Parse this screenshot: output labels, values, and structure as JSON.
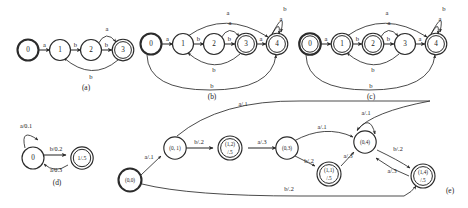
{
  "figure": {
    "background_color": "#ffffff",
    "stroke_color": "#2b2b2b",
    "text_color": "#1a1a1a"
  },
  "panels": [
    {
      "id": "a",
      "caption": "(a)",
      "nodes": [
        {
          "id": "a0",
          "label": "0",
          "shape": "start-circle"
        },
        {
          "id": "a1",
          "label": "1",
          "shape": "circle"
        },
        {
          "id": "a2",
          "label": "2",
          "shape": "circle"
        },
        {
          "id": "a3",
          "label": "3",
          "shape": "double-circle"
        }
      ],
      "edges": [
        {
          "from": "0",
          "to": "1",
          "label": "a"
        },
        {
          "from": "1",
          "to": "2",
          "label": "b"
        },
        {
          "from": "2",
          "to": "3",
          "label": "b"
        },
        {
          "from": "2",
          "to": "3",
          "label": "a",
          "style": "arc-top"
        },
        {
          "from": "3",
          "to": "1",
          "label": "b",
          "style": "arc-bottom"
        }
      ]
    },
    {
      "id": "b",
      "caption": "(b)",
      "nodes": [
        {
          "id": "b0",
          "label": "0",
          "shape": "start-circle"
        },
        {
          "id": "b1",
          "label": "1",
          "shape": "circle"
        },
        {
          "id": "b2",
          "label": "2",
          "shape": "circle"
        },
        {
          "id": "b3",
          "label": "3",
          "shape": "double-circle"
        },
        {
          "id": "b4",
          "label": "4",
          "shape": "double-circle"
        }
      ],
      "edges": [
        {
          "from": "0",
          "to": "1",
          "label": "a"
        },
        {
          "from": "1",
          "to": "2",
          "label": "b"
        },
        {
          "from": "2",
          "to": "3",
          "label": "b"
        },
        {
          "from": "3",
          "to": "4",
          "label": "a"
        },
        {
          "from": "2",
          "to": "3",
          "label": "a",
          "style": "arc-top-small"
        },
        {
          "from": "1",
          "to": "4",
          "label": "a",
          "style": "arc-top-long"
        },
        {
          "from": "4",
          "to": "4",
          "label": "b",
          "style": "self-loop"
        },
        {
          "from": "4",
          "to": "4",
          "label": "a",
          "style": "self-loop-inner"
        },
        {
          "from": "3",
          "to": "1",
          "label": "b",
          "style": "arc-bottom"
        },
        {
          "from": "0",
          "to": "4",
          "label": "b",
          "style": "arc-bottom-long"
        }
      ]
    },
    {
      "id": "c",
      "caption": "(c)",
      "nodes": [
        {
          "id": "c0",
          "label": "0",
          "shape": "double-circle-start"
        },
        {
          "id": "c1",
          "label": "1",
          "shape": "double-circle"
        },
        {
          "id": "c2",
          "label": "2",
          "shape": "double-circle"
        },
        {
          "id": "c3",
          "label": "3",
          "shape": "circle"
        },
        {
          "id": "c4",
          "label": "4",
          "shape": "double-circle"
        }
      ],
      "edges": [
        {
          "from": "0",
          "to": "1",
          "label": "a"
        },
        {
          "from": "1",
          "to": "2",
          "label": "b"
        },
        {
          "from": "2",
          "to": "3",
          "label": "b"
        },
        {
          "from": "3",
          "to": "4",
          "label": "a"
        },
        {
          "from": "2",
          "to": "3",
          "label": "a",
          "style": "arc-top-small"
        },
        {
          "from": "1",
          "to": "4",
          "label": "a",
          "style": "arc-top-long"
        },
        {
          "from": "4",
          "to": "4",
          "label": "b",
          "style": "self-loop"
        },
        {
          "from": "4",
          "to": "4",
          "label": "a",
          "style": "self-loop-inner"
        },
        {
          "from": "3",
          "to": "1",
          "label": "b",
          "style": "arc-bottom"
        },
        {
          "from": "0",
          "to": "4",
          "label": "b",
          "style": "arc-bottom-long"
        }
      ]
    },
    {
      "id": "d",
      "caption": "(d)",
      "nodes": [
        {
          "id": "d0",
          "label": "0",
          "shape": "circle"
        },
        {
          "id": "d1",
          "label": "1/.5",
          "shape": "double-circle"
        }
      ],
      "edges": [
        {
          "from": "0",
          "to": "0",
          "label": "a/0.1",
          "style": "self-loop"
        },
        {
          "from": "0",
          "to": "1/.5",
          "label": "b/0.2"
        },
        {
          "from": "1/.5",
          "to": "0",
          "label": "a/0.3",
          "style": "arc-bottom"
        }
      ]
    },
    {
      "id": "e",
      "caption": "(e)",
      "nodes": [
        {
          "id": "e00",
          "label": "(0,0)",
          "shape": "start-circle"
        },
        {
          "id": "e01",
          "label": "(0, 1)",
          "shape": "circle"
        },
        {
          "id": "e12",
          "label_top": "(1,2)",
          "label_bottom": "/.5",
          "shape": "double-circle"
        },
        {
          "id": "e03",
          "label": "(0,3)",
          "shape": "circle"
        },
        {
          "id": "e11",
          "label_top": "(1,1)",
          "label_bottom": "/.5",
          "shape": "double-circle"
        },
        {
          "id": "e04",
          "label": "(0,4)",
          "shape": "circle"
        },
        {
          "id": "e14",
          "label_top": "(1,4)",
          "label_bottom": "/.5",
          "shape": "double-circle"
        }
      ],
      "edges": [
        {
          "from": "(0,0)",
          "to": "(0, 1)",
          "label": "a/.1"
        },
        {
          "from": "(0, 1)",
          "to": "(1,2)/.5",
          "label": "b/.2"
        },
        {
          "from": "(1,2)/.5",
          "to": "(0,3)",
          "label": "a/.3"
        },
        {
          "from": "(0, 1)",
          "to": "(0,4)",
          "label": "a/.1",
          "style": "arc-top-long"
        },
        {
          "from": "(0,3)",
          "to": "(1,1)/.5",
          "label": "b/.2"
        },
        {
          "from": "(0,3)",
          "to": "(0,4)",
          "label": "a/.1",
          "style": "arc-top"
        },
        {
          "from": "(1,1)/.5",
          "to": "(0,4)",
          "label": "a/.3"
        },
        {
          "from": "(0,4)",
          "to": "(0,4)",
          "label": "a/.1",
          "style": "self-loop"
        },
        {
          "from": "(0,4)",
          "to": "(1,4)/.5",
          "label": "b/.2"
        },
        {
          "from": "(1,4)/.5",
          "to": "(0,4)",
          "label": "a/.3",
          "style": "arc-back"
        },
        {
          "from": "(0,0)",
          "to": "(1,4)/.5",
          "label": "b/.2",
          "style": "arc-bottom-long"
        }
      ]
    }
  ],
  "labels": {
    "a": "a",
    "b": "b",
    "cap_a": "(a)",
    "cap_b": "(b)",
    "cap_c": "(c)",
    "cap_d": "(d)",
    "cap_e": "(e)",
    "n0": "0",
    "n1": "1",
    "n2": "2",
    "n3": "3",
    "n4": "4",
    "d_self": "a/0.1",
    "d_fwd": "b/0.2",
    "d_back": "a/0.3",
    "d_final": "1/.5",
    "e_00": "(0,0)",
    "e_01": "(0, 1)",
    "e_12": "(1,2)",
    "e_12b": "/.5",
    "e_03": "(0,3)",
    "e_11": "(1,1)",
    "e_11b": "/.5",
    "e_04": "(0,4)",
    "e_14": "(1,4)",
    "e_14b": "/.5",
    "e_a1": "a/.1",
    "e_a3": "a/.3",
    "e_b2": "b/.2"
  }
}
